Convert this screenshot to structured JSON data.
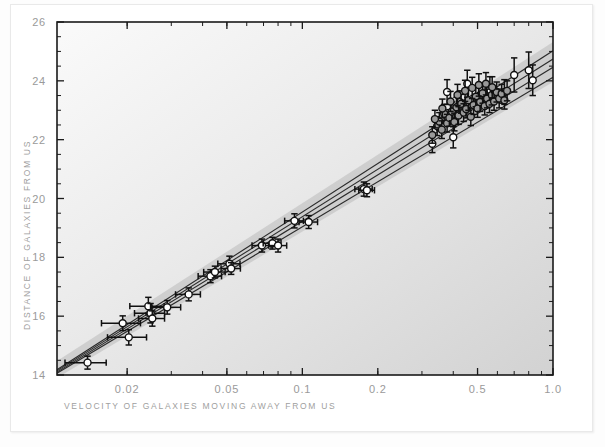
{
  "figure": {
    "background_color": "#ffffff",
    "plot_bg_light": "#f8f8f8",
    "plot_bg_dark": "#d6d6d6",
    "frame_color": "#1a1a1a",
    "marker_open_fill": "#ffffff",
    "marker_gray_fill": "#9a9a9a",
    "marker_edge": "#111111",
    "errorbar_color": "#111111",
    "band_color": "#b9b9b9",
    "line_color": "#2b2b2b"
  },
  "chart_data": {
    "type": "scatter",
    "title": "",
    "subtitle": "",
    "xlabel": "VELOCITY OF GALAXIES MOVING AWAY FROM US",
    "ylabel": "DISTANCE OF GALAXIES FROM US",
    "xscale": "log",
    "yscale": "linear",
    "xlim": [
      0.0105,
      1.0
    ],
    "ylim": [
      14,
      26
    ],
    "grid": false,
    "legend": "none",
    "xticks": [
      0.02,
      0.05,
      0.1,
      0.2,
      0.5,
      1.0
    ],
    "xticklabels": [
      "0.02",
      "0.05",
      "0.1",
      "0.2",
      "0.5",
      "1.0"
    ],
    "yticks": [
      14,
      16,
      18,
      20,
      22,
      24,
      26
    ],
    "yticklabels": [
      "14",
      "16",
      "18",
      "20",
      "22",
      "24",
      "26"
    ],
    "yminor_step": 0.5,
    "series": [
      {
        "name": "low-redshift galaxies",
        "marker": "open-circle",
        "points": [
          {
            "x": 0.0139,
            "y": 14.42,
            "xerr": 0.0026,
            "yerr": 0.22
          },
          {
            "x": 0.0192,
            "y": 15.76,
            "xerr": 0.0034,
            "yerr": 0.25
          },
          {
            "x": 0.0203,
            "y": 15.28,
            "xerr": 0.0036,
            "yerr": 0.26
          },
          {
            "x": 0.0243,
            "y": 16.34,
            "xerr": 0.0038,
            "yerr": 0.3
          },
          {
            "x": 0.0248,
            "y": 16.1,
            "xerr": 0.0034,
            "yerr": 0.33
          },
          {
            "x": 0.0252,
            "y": 15.92,
            "xerr": 0.003,
            "yerr": 0.26
          },
          {
            "x": 0.0289,
            "y": 16.3,
            "xerr": 0.0038,
            "yerr": 0.23
          },
          {
            "x": 0.0352,
            "y": 16.74,
            "xerr": 0.004,
            "yerr": 0.22
          },
          {
            "x": 0.043,
            "y": 17.36,
            "xerr": 0.0046,
            "yerr": 0.22
          },
          {
            "x": 0.0448,
            "y": 17.5,
            "xerr": 0.0044,
            "yerr": 0.2
          },
          {
            "x": 0.0512,
            "y": 17.78,
            "xerr": 0.0052,
            "yerr": 0.26
          },
          {
            "x": 0.052,
            "y": 17.62,
            "xerr": 0.0046,
            "yerr": 0.2
          },
          {
            "x": 0.069,
            "y": 18.4,
            "xerr": 0.006,
            "yerr": 0.22
          },
          {
            "x": 0.076,
            "y": 18.48,
            "xerr": 0.0062,
            "yerr": 0.2
          },
          {
            "x": 0.08,
            "y": 18.4,
            "xerr": 0.0066,
            "yerr": 0.22
          },
          {
            "x": 0.093,
            "y": 19.24,
            "xerr": 0.008,
            "yerr": 0.24
          },
          {
            "x": 0.106,
            "y": 19.2,
            "xerr": 0.009,
            "yerr": 0.22
          },
          {
            "x": 0.176,
            "y": 20.32,
            "xerr": 0.014,
            "yerr": 0.24
          },
          {
            "x": 0.181,
            "y": 20.28,
            "xerr": 0.013,
            "yerr": 0.22
          }
        ]
      },
      {
        "name": "high-redshift supernovae (open)",
        "marker": "open-circle",
        "points": [
          {
            "x": 0.33,
            "y": 21.86,
            "yerr": 0.3
          },
          {
            "x": 0.378,
            "y": 23.62,
            "yerr": 0.42
          },
          {
            "x": 0.4,
            "y": 22.08,
            "yerr": 0.36
          },
          {
            "x": 0.425,
            "y": 23.28,
            "yerr": 0.38
          },
          {
            "x": 0.455,
            "y": 23.9,
            "yerr": 0.46
          },
          {
            "x": 0.505,
            "y": 23.44,
            "yerr": 0.4
          },
          {
            "x": 0.56,
            "y": 23.7,
            "yerr": 0.44
          },
          {
            "x": 0.64,
            "y": 23.62,
            "yerr": 0.42
          },
          {
            "x": 0.7,
            "y": 24.2,
            "yerr": 0.58
          },
          {
            "x": 0.8,
            "y": 24.36,
            "yerr": 0.62
          },
          {
            "x": 0.83,
            "y": 24.02,
            "yerr": 0.52
          }
        ]
      },
      {
        "name": "high-redshift supernovae (filled)",
        "marker": "gray-circle",
        "points": [
          {
            "x": 0.345,
            "y": 22.46,
            "yerr": 0.32
          },
          {
            "x": 0.352,
            "y": 22.62,
            "yerr": 0.3
          },
          {
            "x": 0.36,
            "y": 22.34,
            "yerr": 0.3
          },
          {
            "x": 0.368,
            "y": 22.88,
            "yerr": 0.32
          },
          {
            "x": 0.378,
            "y": 22.56,
            "yerr": 0.3
          },
          {
            "x": 0.386,
            "y": 22.74,
            "yerr": 0.28
          },
          {
            "x": 0.395,
            "y": 22.96,
            "yerr": 0.32
          },
          {
            "x": 0.404,
            "y": 22.6,
            "yerr": 0.3
          },
          {
            "x": 0.412,
            "y": 23.1,
            "yerr": 0.34
          },
          {
            "x": 0.42,
            "y": 22.82,
            "yerr": 0.3
          },
          {
            "x": 0.43,
            "y": 23.22,
            "yerr": 0.32
          },
          {
            "x": 0.44,
            "y": 22.92,
            "yerr": 0.3
          },
          {
            "x": 0.45,
            "y": 23.04,
            "yerr": 0.3
          },
          {
            "x": 0.46,
            "y": 23.34,
            "yerr": 0.34
          },
          {
            "x": 0.47,
            "y": 22.78,
            "yerr": 0.3
          },
          {
            "x": 0.482,
            "y": 23.18,
            "yerr": 0.32
          },
          {
            "x": 0.492,
            "y": 23.46,
            "yerr": 0.34
          },
          {
            "x": 0.5,
            "y": 23.06,
            "yerr": 0.3
          },
          {
            "x": 0.512,
            "y": 23.28,
            "yerr": 0.32
          },
          {
            "x": 0.524,
            "y": 23.58,
            "yerr": 0.34
          },
          {
            "x": 0.534,
            "y": 23.14,
            "yerr": 0.3
          },
          {
            "x": 0.546,
            "y": 23.4,
            "yerr": 0.32
          },
          {
            "x": 0.558,
            "y": 23.22,
            "yerr": 0.3
          },
          {
            "x": 0.57,
            "y": 23.52,
            "yerr": 0.34
          },
          {
            "x": 0.582,
            "y": 23.3,
            "yerr": 0.3
          },
          {
            "x": 0.596,
            "y": 23.62,
            "yerr": 0.34
          },
          {
            "x": 0.61,
            "y": 23.4,
            "yerr": 0.32
          },
          {
            "x": 0.624,
            "y": 23.56,
            "yerr": 0.32
          },
          {
            "x": 0.64,
            "y": 23.34,
            "yerr": 0.3
          },
          {
            "x": 0.656,
            "y": 23.66,
            "yerr": 0.34
          },
          {
            "x": 0.33,
            "y": 22.16,
            "yerr": 0.28
          },
          {
            "x": 0.338,
            "y": 22.7,
            "yerr": 0.3
          },
          {
            "x": 0.362,
            "y": 23.06,
            "yerr": 0.32
          },
          {
            "x": 0.39,
            "y": 23.3,
            "yerr": 0.34
          },
          {
            "x": 0.416,
            "y": 23.52,
            "yerr": 0.36
          },
          {
            "x": 0.446,
            "y": 23.66,
            "yerr": 0.36
          },
          {
            "x": 0.476,
            "y": 23.76,
            "yerr": 0.36
          },
          {
            "x": 0.506,
            "y": 23.86,
            "yerr": 0.38
          },
          {
            "x": 0.54,
            "y": 23.9,
            "yerr": 0.38
          },
          {
            "x": 0.572,
            "y": 23.78,
            "yerr": 0.36
          }
        ]
      }
    ],
    "model_lines": [
      {
        "name": "model-1",
        "y_at_xmin": 14.06,
        "y_at_xmax": 24.12
      },
      {
        "name": "model-2",
        "y_at_xmin": 14.1,
        "y_at_xmax": 24.46
      },
      {
        "name": "model-3",
        "y_at_xmin": 14.14,
        "y_at_xmax": 24.74
      },
      {
        "name": "model-4",
        "y_at_xmin": 14.18,
        "y_at_xmax": 25.02
      }
    ],
    "confidence_band": {
      "name": "uncertainty-band",
      "lower_offset": -0.16,
      "upper_offset": 0.3
    }
  }
}
